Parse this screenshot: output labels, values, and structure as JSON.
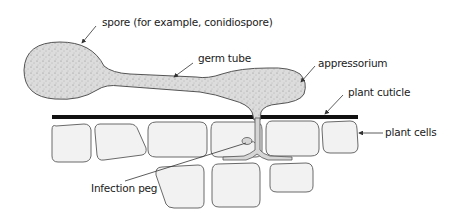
{
  "diagram": {
    "labels": {
      "spore": "spore  (for example, conidiospore)",
      "germ_tube": "germ tube",
      "appressorium": "appressorium",
      "plant_cuticle": "plant cuticle",
      "plant_cells": "plant cells",
      "infection_peg": "Infection peg"
    },
    "colors": {
      "fungus_fill": "#dcdcdc",
      "fungus_outline": "#555555",
      "cell_fill": "#f2f2f2",
      "cell_outline": "#6a6a6a",
      "cuticle": "#111111",
      "arrow": "#333333"
    }
  }
}
